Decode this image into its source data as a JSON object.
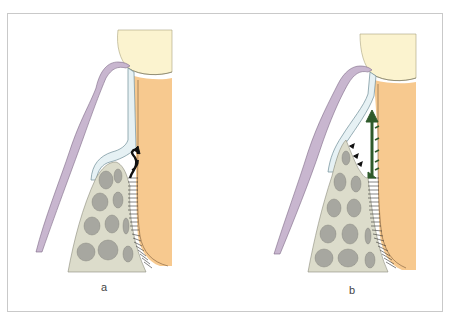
{
  "figure": {
    "panels": [
      {
        "id": "a",
        "label": "a"
      },
      {
        "id": "b",
        "label": "b"
      }
    ]
  },
  "colors": {
    "frame": "#c9c9c9",
    "enamel": "#fbf3cf",
    "root_dentin": "#f7c98f",
    "gingiva": "#c8b6cf",
    "gingiva_outline": "#7d6a86",
    "junctional_epithelium": "#e6f1f4",
    "epithelium_outline": "#6f8c96",
    "bone": "#dcdccb",
    "bone_marrow": "#a7a7a0",
    "pdl_fibers": "#333333",
    "arrow_a": "#111111",
    "arrow_b": "#2f5a2b"
  }
}
